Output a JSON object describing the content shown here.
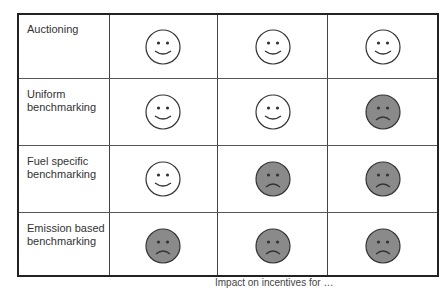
{
  "rows": [
    {
      "label": "Auctioning",
      "faces": [
        "happy",
        "happy",
        "happy"
      ]
    },
    {
      "label": "Uniform benchmarking",
      "faces": [
        "happy",
        "happy",
        "sad"
      ]
    },
    {
      "label": "Fuel specific benchmarking",
      "faces": [
        "happy",
        "sad",
        "sad"
      ]
    },
    {
      "label": "Emission based benchmarking",
      "faces": [
        "sad",
        "sad",
        "sad"
      ]
    }
  ],
  "caption": "Impact on incentives for …",
  "colors": {
    "happy_fill": "#ffffff",
    "sad_fill": "#8a8a8a",
    "stroke": "#333333"
  }
}
